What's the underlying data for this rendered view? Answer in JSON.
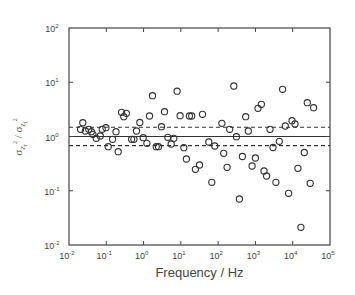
{
  "chart_data": {
    "type": "scatter",
    "title": "",
    "xlabel": "Frequency / Hz",
    "ylabel": "σ²Zr / σ²Zi",
    "ylabel_parts": {
      "num": "σ",
      "num_sup": "2",
      "num_sub": "Z",
      "num_subsub": "r",
      "sep": " / ",
      "den": "σ",
      "den_sup": "2",
      "den_sub": "Z",
      "den_subsub": "i"
    },
    "xscale": "log",
    "yscale": "log",
    "xlim": [
      0.01,
      100000
    ],
    "ylim": [
      0.01,
      100
    ],
    "grid": false,
    "legend": null,
    "x_ticks": [
      {
        "base": "10",
        "exp": "-2"
      },
      {
        "base": "10",
        "exp": "-1"
      },
      {
        "base": "10",
        "exp": "0"
      },
      {
        "base": "10",
        "exp": "1"
      },
      {
        "base": "10",
        "exp": "2"
      },
      {
        "base": "10",
        "exp": "3"
      },
      {
        "base": "10",
        "exp": "4"
      },
      {
        "base": "10",
        "exp": "5"
      }
    ],
    "y_ticks": [
      {
        "base": "10",
        "exp": "-2"
      },
      {
        "base": "10",
        "exp": "-1"
      },
      {
        "base": "10",
        "exp": "0"
      },
      {
        "base": "10",
        "exp": "1"
      },
      {
        "base": "10",
        "exp": "2"
      }
    ],
    "reference_lines": [
      {
        "y": 1.0,
        "style": "solid",
        "label": "mean"
      },
      {
        "y": 1.48,
        "style": "dashed",
        "label": "upper bound"
      },
      {
        "y": 0.68,
        "style": "dashed",
        "label": "lower bound"
      }
    ],
    "marker": "open-circle",
    "series": [
      {
        "name": "data",
        "log10_points": [
          [
            -1.63,
            0.254
          ],
          [
            -1.69,
            0.133
          ],
          [
            -1.56,
            0.101
          ],
          [
            -1.47,
            0.133
          ],
          [
            -1.4,
            0.089
          ],
          [
            -1.36,
            0.041
          ],
          [
            -1.27,
            -0.033
          ],
          [
            -1.16,
            0.009
          ],
          [
            -1.11,
            0.133
          ],
          [
            -1.01,
            0.162
          ],
          [
            -0.95,
            -0.188
          ],
          [
            -0.83,
            -0.052
          ],
          [
            -0.74,
            0.089
          ],
          [
            -0.68,
            -0.28
          ],
          [
            -0.59,
            0.446
          ],
          [
            -0.46,
            0.428
          ],
          [
            -0.53,
            0.365
          ],
          [
            -0.32,
            -0.052
          ],
          [
            -0.26,
            -0.052
          ],
          [
            -0.19,
            0.101
          ],
          [
            -0.1,
            0.258
          ],
          [
            -0.01,
            -0.022
          ],
          [
            0.09,
            -0.125
          ],
          [
            0.16,
            0.378
          ],
          [
            0.24,
            0.752
          ],
          [
            0.34,
            -0.188
          ],
          [
            0.4,
            -0.188
          ],
          [
            0.48,
            0.181
          ],
          [
            0.56,
            0.457
          ],
          [
            0.65,
            -0.015
          ],
          [
            0.74,
            -0.138
          ],
          [
            0.81,
            -0.033
          ],
          [
            0.9,
            0.835
          ],
          [
            0.98,
            0.383
          ],
          [
            1.08,
            -0.206
          ],
          [
            1.15,
            -0.415
          ],
          [
            1.23,
            0.378
          ],
          [
            1.29,
            0.378
          ],
          [
            1.39,
            -0.604
          ],
          [
            1.5,
            -0.525
          ],
          [
            1.58,
            0.409
          ],
          [
            1.75,
            -0.101
          ],
          [
            1.83,
            -0.844
          ],
          [
            1.91,
            -0.175
          ],
          [
            2.1,
            0.243
          ],
          [
            2.15,
            -0.31
          ],
          [
            2.24,
            -0.568
          ],
          [
            2.31,
            0.133
          ],
          [
            2.42,
            0.931
          ],
          [
            2.49,
            -0.004
          ],
          [
            2.57,
            -1.152
          ],
          [
            2.65,
            -0.369
          ],
          [
            2.74,
            0.365
          ],
          [
            2.81,
            0.101
          ],
          [
            2.91,
            -0.544
          ],
          [
            3.0,
            -0.396
          ],
          [
            3.07,
            0.52
          ],
          [
            3.16,
            0.594
          ],
          [
            3.23,
            -0.636
          ],
          [
            3.3,
            -0.728
          ],
          [
            3.39,
            0.133
          ],
          [
            3.47,
            -0.203
          ],
          [
            3.55,
            -0.844
          ],
          [
            3.64,
            -0.088
          ],
          [
            3.73,
            0.87
          ],
          [
            3.8,
            0.194
          ],
          [
            3.89,
            -1.047
          ],
          [
            3.98,
            0.291
          ],
          [
            4.06,
            0.23
          ],
          [
            4.14,
            -0.586
          ],
          [
            4.22,
            -1.674
          ],
          [
            4.31,
            -0.295
          ],
          [
            4.39,
            0.623
          ],
          [
            4.47,
            -0.863
          ],
          [
            4.56,
            0.531
          ]
        ]
      }
    ]
  }
}
